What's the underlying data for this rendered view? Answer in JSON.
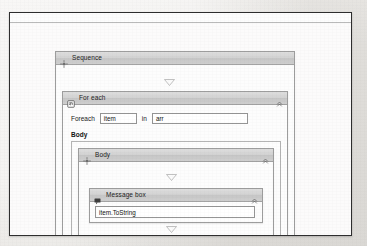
{
  "window": {
    "name": "workflow-designer-window"
  },
  "designer": {
    "sequence": {
      "title": "Sequence",
      "icon": "sequence-icon",
      "collapse_icon": "chevron-double-up-icon"
    },
    "for_each": {
      "title": "For each",
      "icon": "for-each-icon",
      "collapse_icon": "chevron-double-up-icon",
      "foreach_label": "Foreach",
      "item_value": "item",
      "item_placeholder": "item",
      "in_label": "in",
      "collection_value": "arr",
      "collection_placeholder": "arr",
      "body_label": "Body"
    },
    "body": {
      "title": "Body",
      "icon": "sequence-icon",
      "collapse_icon": "chevron-double-up-icon"
    },
    "message_box": {
      "title": "Message box",
      "icon": "message-box-icon",
      "collapse_icon": "chevron-double-up-icon",
      "expression_value": "item.ToString",
      "expression_placeholder": "item.ToString"
    },
    "drop_indicator_icon": "drop-triangle-icon"
  },
  "colors": {
    "header_gradient_top": "#dedede",
    "header_gradient_bottom": "#cfcfcf",
    "border": "#9d9d9d",
    "canvas": "#fcfbfb",
    "window_border": "#2e2e2e"
  }
}
